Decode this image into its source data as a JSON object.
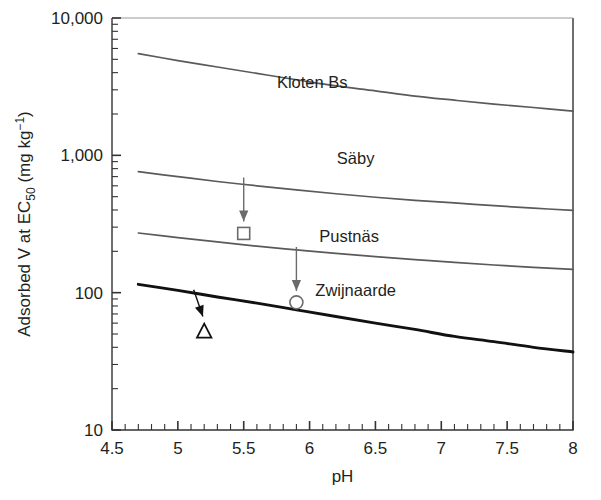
{
  "chart_data": {
    "type": "line",
    "title": "",
    "xlabel": "pH",
    "ylabel_parts": {
      "main_a": "Adsorbed V at EC",
      "sub": "50",
      "main_b": " (mg kg",
      "sup": "−1",
      "main_c": ")"
    },
    "ylabel": "Adsorbed V at EC50 (mg kg-1)",
    "xlim": [
      4.5,
      8
    ],
    "ylim": [
      10,
      10000
    ],
    "yscale": "log",
    "grid": false,
    "legend_position": "inline-labels",
    "x_ticks_major": [
      "4.5",
      "5",
      "5.5",
      "6",
      "6.5",
      "7",
      "7.5",
      "8"
    ],
    "x_ticks_major_values": [
      4.5,
      5,
      5.5,
      6,
      6.5,
      7,
      7.5,
      8
    ],
    "x_minor_step": 0.1,
    "y_ticks_major": [
      "10,000",
      "1,000",
      "100",
      "10"
    ],
    "y_ticks_major_values": [
      10000,
      1000,
      100,
      10
    ],
    "series": [
      {
        "name": "Kloten Bs",
        "color": "#5a5a5a",
        "width": 1.7,
        "label_x": 6.02,
        "label_y": 3100,
        "x": [
          4.7,
          5.0,
          5.3,
          5.6,
          5.9,
          6.2,
          6.5,
          6.8,
          7.1,
          7.4,
          7.7,
          8.0
        ],
        "y": [
          5500,
          4900,
          4400,
          3950,
          3550,
          3200,
          2950,
          2700,
          2520,
          2360,
          2230,
          2100
        ]
      },
      {
        "name": "Säby",
        "color": "#5a5a5a",
        "width": 1.7,
        "label_x": 6.35,
        "label_y": 860,
        "x": [
          4.7,
          5.0,
          5.3,
          5.6,
          5.9,
          6.2,
          6.5,
          6.8,
          7.1,
          7.4,
          7.7,
          8.0
        ],
        "y": [
          760,
          700,
          645,
          600,
          560,
          525,
          495,
          470,
          450,
          430,
          412,
          398
        ]
      },
      {
        "name": "Pustnäs",
        "color": "#5a5a5a",
        "width": 1.7,
        "label_x": 6.3,
        "label_y": 235,
        "x": [
          4.7,
          5.0,
          5.3,
          5.6,
          5.9,
          6.2,
          6.5,
          6.8,
          7.1,
          7.4,
          7.7,
          8.0
        ],
        "y": [
          272,
          252,
          234,
          218,
          205,
          193,
          183,
          174,
          166,
          159,
          153,
          148
        ]
      },
      {
        "name": "Zwijnaarde",
        "color": "#111111",
        "width": 2.9,
        "label_x": 6.35,
        "label_y": 95,
        "x": [
          4.7,
          5.0,
          5.3,
          5.6,
          5.9,
          6.2,
          6.5,
          6.8,
          7.1,
          7.4,
          7.7,
          8.0
        ],
        "y": [
          115,
          104,
          93,
          84,
          75,
          67,
          60,
          54,
          48,
          44,
          40,
          37
        ]
      }
    ],
    "markers": [
      {
        "shape": "square",
        "name": "square-marker",
        "x": 5.5,
        "y": 270,
        "arrow_from_y": 690,
        "arrow_to_y": 330,
        "color": "#6b6b6b"
      },
      {
        "shape": "circle",
        "name": "circle-marker",
        "x": 5.9,
        "y": 85,
        "arrow_from_y": 215,
        "arrow_to_y": 103,
        "color": "#6b6b6b"
      },
      {
        "shape": "triangle",
        "name": "triangle-marker",
        "x": 5.2,
        "y": 52,
        "arrow_from_x": 5.12,
        "arrow_from_y": 105,
        "arrow_to_x": 5.19,
        "arrow_to_y": 67,
        "color": "#111111"
      }
    ]
  }
}
